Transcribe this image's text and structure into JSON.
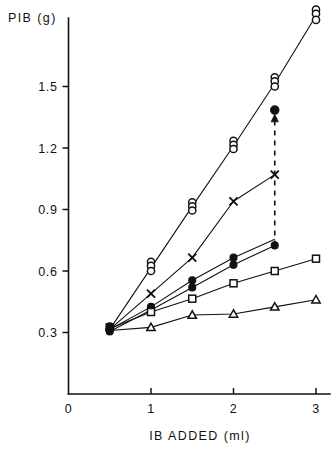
{
  "chart_data": {
    "type": "scatter",
    "title": "",
    "subtitle": "",
    "xlabel": "IB ADDED (ml)",
    "ylabel": "PIB (g)",
    "xlim": [
      0,
      3.2
    ],
    "ylim": [
      0,
      1.95
    ],
    "xticks": [
      0,
      1,
      2,
      3
    ],
    "xtick_labels": [
      "0",
      "1",
      "2",
      "3"
    ],
    "yticks": [
      0.3,
      0.6,
      0.9,
      1.2,
      1.5
    ],
    "ytick_labels": [
      "0.3",
      "0.6",
      "0.9",
      "1.2",
      "1.5"
    ],
    "grid": false,
    "legend": "none",
    "origin_label": "0",
    "series": [
      {
        "name": "open-circle-series",
        "marker": "open-circle",
        "line": "solid",
        "points": [
          {
            "x": 0.5,
            "y": 0.315
          },
          {
            "x": 1.0,
            "y": 0.615
          },
          {
            "x": 1.5,
            "y": 0.915
          },
          {
            "x": 2.0,
            "y": 1.21
          },
          {
            "x": 2.5,
            "y": 1.515
          },
          {
            "x": 3.0,
            "y": 1.845
          }
        ],
        "replicates": [
          {
            "x": 0.5,
            "values": [
              0.315
            ]
          },
          {
            "x": 1.0,
            "values": [
              0.645,
              0.625,
              0.6
            ]
          },
          {
            "x": 1.5,
            "values": [
              0.935,
              0.915,
              0.895
            ]
          },
          {
            "x": 2.0,
            "values": [
              1.235,
              1.215,
              1.195
            ]
          },
          {
            "x": 2.5,
            "values": [
              1.545,
              1.525,
              1.5
            ]
          },
          {
            "x": 3.0,
            "values": [
              1.875,
              1.855,
              1.825
            ]
          }
        ]
      },
      {
        "name": "cross-series",
        "marker": "cross",
        "line": "solid",
        "points": [
          {
            "x": 0.5,
            "y": 0.315
          },
          {
            "x": 1.0,
            "y": 0.49
          },
          {
            "x": 1.5,
            "y": 0.665
          },
          {
            "x": 2.0,
            "y": 0.94
          },
          {
            "x": 2.5,
            "y": 1.07
          }
        ],
        "replicates": [
          {
            "x": 1.0,
            "values": [
              0.49
            ]
          },
          {
            "x": 1.5,
            "values": [
              0.665
            ]
          },
          {
            "x": 2.0,
            "values": [
              0.94
            ]
          },
          {
            "x": 2.5,
            "values": [
              1.07
            ]
          }
        ]
      },
      {
        "name": "filled-circle-series-upper",
        "marker": "filled-circle",
        "line": "solid",
        "points": [
          {
            "x": 0.5,
            "y": 0.315
          },
          {
            "x": 1.0,
            "y": 0.425
          },
          {
            "x": 1.5,
            "y": 0.555
          },
          {
            "x": 2.0,
            "y": 0.665
          },
          {
            "x": 2.5,
            "y": 0.755
          }
        ],
        "replicates": [
          {
            "x": 1.0,
            "values": [
              0.425
            ]
          },
          {
            "x": 1.5,
            "values": [
              0.555
            ]
          },
          {
            "x": 2.0,
            "values": [
              0.665
            ]
          }
        ]
      },
      {
        "name": "filled-circle-series-lower",
        "marker": "filled-circle",
        "line": "solid",
        "points": [
          {
            "x": 0.5,
            "y": 0.305
          },
          {
            "x": 1.0,
            "y": 0.41
          },
          {
            "x": 1.5,
            "y": 0.52
          },
          {
            "x": 2.0,
            "y": 0.63
          },
          {
            "x": 2.5,
            "y": 0.725
          }
        ],
        "replicates": [
          {
            "x": 1.0,
            "values": [
              0.41
            ]
          },
          {
            "x": 1.5,
            "values": [
              0.52
            ]
          },
          {
            "x": 2.0,
            "values": [
              0.63
            ]
          },
          {
            "x": 2.5,
            "values": [
              0.725
            ]
          }
        ]
      },
      {
        "name": "open-square-series",
        "marker": "open-square",
        "line": "solid",
        "points": [
          {
            "x": 0.5,
            "y": 0.32
          },
          {
            "x": 1.0,
            "y": 0.4
          },
          {
            "x": 1.5,
            "y": 0.465
          },
          {
            "x": 2.0,
            "y": 0.54
          },
          {
            "x": 2.5,
            "y": 0.6
          },
          {
            "x": 3.0,
            "y": 0.66
          }
        ],
        "replicates": [
          {
            "x": 1.0,
            "values": [
              0.4
            ]
          },
          {
            "x": 1.5,
            "values": [
              0.465
            ]
          },
          {
            "x": 2.0,
            "values": [
              0.54
            ]
          },
          {
            "x": 2.5,
            "values": [
              0.6
            ]
          },
          {
            "x": 3.0,
            "values": [
              0.66
            ]
          }
        ]
      },
      {
        "name": "open-triangle-series",
        "marker": "open-triangle",
        "line": "solid",
        "points": [
          {
            "x": 0.5,
            "y": 0.31
          },
          {
            "x": 1.0,
            "y": 0.325
          },
          {
            "x": 1.5,
            "y": 0.385
          },
          {
            "x": 2.0,
            "y": 0.39
          },
          {
            "x": 2.5,
            "y": 0.425
          },
          {
            "x": 3.0,
            "y": 0.46
          }
        ],
        "replicates": [
          {
            "x": 1.0,
            "values": [
              0.325
            ]
          },
          {
            "x": 1.5,
            "values": [
              0.385
            ]
          },
          {
            "x": 2.0,
            "values": [
              0.39
            ]
          },
          {
            "x": 2.5,
            "values": [
              0.425
            ]
          },
          {
            "x": 3.0,
            "values": [
              0.46
            ]
          }
        ]
      }
    ],
    "annotations": [
      {
        "name": "upward-arrow-annotation",
        "type": "dashed-arrow",
        "x": 2.5,
        "y_from": 0.725,
        "y_to": 1.33,
        "head_marker": "filled-circle",
        "head_y": 1.385
      }
    ],
    "colors": {
      "ink": "#111111",
      "background": "#ffffff"
    }
  }
}
